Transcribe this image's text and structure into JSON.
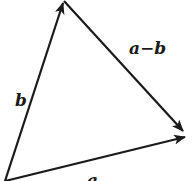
{
  "diagram": {
    "type": "vector-triangle",
    "stroke_color": "#1a1a1a",
    "background": "#ffffff",
    "points": {
      "origin": {
        "x": 5,
        "y": 181
      },
      "b_tip": {
        "x": 64,
        "y": 1
      },
      "a_tip": {
        "x": 187,
        "y": 137
      }
    },
    "vectors": [
      {
        "id": "b",
        "label": "b",
        "from": "origin",
        "to": "b_tip"
      },
      {
        "id": "a",
        "label": "a",
        "from": "origin",
        "to": "a_tip"
      },
      {
        "id": "a_minus_b",
        "label": "a−b",
        "from": "b_tip",
        "to": "a_tip"
      }
    ],
    "labels": {
      "b": "b",
      "a": "a",
      "a_minus_b": "a−b"
    }
  }
}
